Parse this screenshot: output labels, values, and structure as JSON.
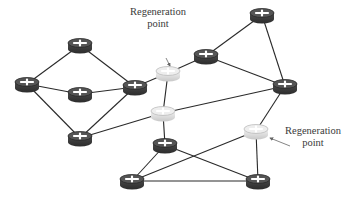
{
  "diagram": {
    "colors": {
      "background": "#ffffff",
      "link": "#2a2a2a",
      "router_dark": "#3a3a3a",
      "router_dark_top": "#555555",
      "router_light": "#d8d8d8",
      "router_light_top": "#eeeeee",
      "cross": "#ffffff",
      "arrow": "#666666",
      "label_text": "#3a3a3a"
    },
    "nodes": [
      {
        "id": "n1",
        "x": 80,
        "y": 45,
        "type": "router"
      },
      {
        "id": "n2",
        "x": 27,
        "y": 84,
        "type": "router"
      },
      {
        "id": "n3",
        "x": 80,
        "y": 94,
        "type": "router"
      },
      {
        "id": "n4",
        "x": 135,
        "y": 87,
        "type": "router"
      },
      {
        "id": "n5",
        "x": 168,
        "y": 73,
        "type": "regeneration"
      },
      {
        "id": "n6",
        "x": 206,
        "y": 56,
        "type": "router"
      },
      {
        "id": "n7",
        "x": 262,
        "y": 15,
        "type": "router"
      },
      {
        "id": "n8",
        "x": 285,
        "y": 86,
        "type": "router"
      },
      {
        "id": "n9",
        "x": 163,
        "y": 113,
        "type": "regeneration"
      },
      {
        "id": "n10",
        "x": 256,
        "y": 131,
        "type": "regeneration"
      },
      {
        "id": "n11",
        "x": 165,
        "y": 145,
        "type": "router"
      },
      {
        "id": "n12",
        "x": 80,
        "y": 138,
        "type": "router"
      },
      {
        "id": "n13",
        "x": 132,
        "y": 181,
        "type": "router"
      },
      {
        "id": "n14",
        "x": 258,
        "y": 181,
        "type": "router"
      }
    ],
    "links": [
      [
        "n1",
        "n2"
      ],
      [
        "n1",
        "n4"
      ],
      [
        "n2",
        "n3"
      ],
      [
        "n2",
        "n12"
      ],
      [
        "n3",
        "n4"
      ],
      [
        "n4",
        "n5"
      ],
      [
        "n4",
        "n12"
      ],
      [
        "n5",
        "n6"
      ],
      [
        "n5",
        "n9"
      ],
      [
        "n6",
        "n7"
      ],
      [
        "n6",
        "n8"
      ],
      [
        "n7",
        "n8"
      ],
      [
        "n8",
        "n9"
      ],
      [
        "n8",
        "n10"
      ],
      [
        "n9",
        "n12"
      ],
      [
        "n9",
        "n11"
      ],
      [
        "n11",
        "n13"
      ],
      [
        "n11",
        "n14"
      ],
      [
        "n10",
        "n13"
      ],
      [
        "n10",
        "n14"
      ],
      [
        "n13",
        "n14"
      ]
    ],
    "annotations": [
      {
        "id": "regen-label-1",
        "line1": "Regeneration",
        "line2": "point",
        "x": 158,
        "y": 12,
        "arrow_from": [
          166,
          58
        ],
        "arrow_to": [
          170,
          66
        ]
      },
      {
        "id": "regen-label-2",
        "line1": "Regeneration",
        "line2": "point",
        "x": 313,
        "y": 131,
        "arrow_from": [
          290,
          146
        ],
        "arrow_to": [
          270,
          138
        ]
      }
    ]
  }
}
